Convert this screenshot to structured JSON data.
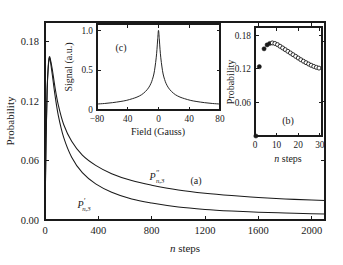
{
  "figure": {
    "background": "#ffffff",
    "ink_color": "#1a1a1a"
  },
  "chart_data": [
    {
      "id": "main",
      "panel_label": "(a)",
      "type": "line",
      "title": "",
      "xlabel": "n steps",
      "ylabel": "Probability",
      "xlim": [
        0,
        2100
      ],
      "ylim": [
        0.0,
        0.2
      ],
      "xticks": [
        0,
        400,
        800,
        1200,
        1600,
        2000
      ],
      "xticklabels": [
        "0",
        "400",
        "800",
        "1200",
        "1600",
        "2000"
      ],
      "yticks": [
        0.0,
        0.06,
        0.12,
        0.18
      ],
      "yticklabels": [
        "0.00",
        "0.06",
        "0.12",
        "0.18"
      ],
      "grid": false,
      "legend": "inline-curve-labels",
      "series": [
        {
          "name": "P''_n,3",
          "label_base": "P",
          "label_sub": "n,3",
          "label_prime": "′′",
          "label_x": 900,
          "label_y": 0.041,
          "comment_shape": "sharp rise to peak near n=30 then slow power-law decay",
          "x": [
            0,
            8,
            16,
            24,
            32,
            40,
            55,
            75,
            100,
            140,
            200,
            280,
            380,
            500,
            650,
            800,
            1000,
            1200,
            1400,
            1600,
            1800,
            2000,
            2100
          ],
          "y": [
            0.0,
            0.082,
            0.132,
            0.155,
            0.1645,
            0.1625,
            0.152,
            0.134,
            0.116,
            0.0965,
            0.0795,
            0.0655,
            0.0552,
            0.0468,
            0.0398,
            0.0352,
            0.0304,
            0.0271,
            0.0247,
            0.0228,
            0.0213,
            0.0201,
            0.0196
          ]
        },
        {
          "name": "P'_n,3",
          "label_base": "P",
          "label_sub": "n,3",
          "label_prime": "′",
          "label_x": 215,
          "label_y": 0.0175,
          "comment_shape": "same sharp rise, faster decay, approaches ~0.006 at n=2100",
          "x": [
            0,
            8,
            16,
            24,
            32,
            40,
            55,
            75,
            100,
            140,
            200,
            280,
            380,
            500,
            650,
            800,
            1000,
            1200,
            1400,
            1600,
            1800,
            2000,
            2100
          ],
          "y": [
            0.0,
            0.081,
            0.13,
            0.153,
            0.1635,
            0.1605,
            0.1465,
            0.126,
            0.1055,
            0.0835,
            0.0635,
            0.0478,
            0.0365,
            0.0281,
            0.0212,
            0.0171,
            0.0131,
            0.0107,
            0.0091,
            0.0079,
            0.0071,
            0.0064,
            0.0061
          ]
        }
      ]
    },
    {
      "id": "inset_c",
      "panel_label": "(c)",
      "type": "line",
      "title": "",
      "xlabel": "Field (Gauss)",
      "ylabel": "Signal (a.u.)",
      "xlim": [
        -80,
        80
      ],
      "ylim": [
        0,
        1.08
      ],
      "xticks": [
        -80,
        -40,
        0,
        40,
        80
      ],
      "xticklabels": [
        "−80",
        "40",
        "0",
        "40",
        "80"
      ],
      "yticks": [
        0,
        0.5,
        1.0
      ],
      "yticklabels": [
        "0",
        "0.5",
        "1.0"
      ],
      "grid": false,
      "series": [
        {
          "name": "signal",
          "comment_shape": "narrow Lorentzian-like peak centred at 0 Gauss, HWHM ~6 G, tails ~0.08",
          "x": [
            -80,
            -70,
            -60,
            -50,
            -42,
            -34,
            -28,
            -22,
            -17,
            -13,
            -10,
            -8,
            -6,
            -4.5,
            -3,
            -2,
            -1,
            0,
            1,
            2,
            3,
            4.5,
            6,
            8,
            10,
            13,
            17,
            22,
            28,
            34,
            42,
            50,
            60,
            70,
            80
          ],
          "y": [
            0.075,
            0.082,
            0.092,
            0.106,
            0.12,
            0.142,
            0.162,
            0.192,
            0.232,
            0.278,
            0.33,
            0.382,
            0.452,
            0.54,
            0.655,
            0.76,
            0.895,
            1.0,
            0.895,
            0.76,
            0.655,
            0.54,
            0.452,
            0.382,
            0.33,
            0.278,
            0.232,
            0.192,
            0.162,
            0.142,
            0.12,
            0.106,
            0.092,
            0.082,
            0.075
          ]
        }
      ]
    },
    {
      "id": "inset_b",
      "panel_label": "(b)",
      "type": "scatter",
      "title": "",
      "xlabel": "n steps",
      "ylabel": "Probability",
      "xlim": [
        0,
        31
      ],
      "ylim": [
        0.0,
        0.195
      ],
      "xticks": [
        0,
        10,
        20,
        30
      ],
      "xticklabels": [
        "0",
        "10",
        "20",
        "30"
      ],
      "yticks": [
        0.06,
        0.12,
        0.18
      ],
      "yticklabels": [
        "0.06",
        "0.12",
        "0.18"
      ],
      "grid": false,
      "series": [
        {
          "name": "measured",
          "marker": "mixed-filled-then-open",
          "comment_shape": "rises from 0 at n=0, point at n=2 ~0.124, peaks ~0.165 near n=8, then slow linear decline to ~0.122 at n=30",
          "points": [
            {
              "x": 0.4,
              "y": 0.0,
              "marker": "filled"
            },
            {
              "x": 2.0,
              "y": 0.124,
              "marker": "filled"
            },
            {
              "x": 4.2,
              "y": 0.156,
              "marker": "filled"
            },
            {
              "x": 5.6,
              "y": 0.163,
              "marker": "filled"
            },
            {
              "x": 6.8,
              "y": 0.1655,
              "marker": "filled"
            },
            {
              "x": 8.0,
              "y": 0.1665,
              "marker": "open"
            },
            {
              "x": 9.2,
              "y": 0.1655,
              "marker": "open"
            },
            {
              "x": 10.4,
              "y": 0.1635,
              "marker": "open"
            },
            {
              "x": 11.6,
              "y": 0.1605,
              "marker": "open"
            },
            {
              "x": 12.8,
              "y": 0.1575,
              "marker": "open"
            },
            {
              "x": 14.0,
              "y": 0.1545,
              "marker": "open"
            },
            {
              "x": 15.2,
              "y": 0.1515,
              "marker": "open"
            },
            {
              "x": 16.4,
              "y": 0.1485,
              "marker": "open"
            },
            {
              "x": 17.6,
              "y": 0.1455,
              "marker": "open"
            },
            {
              "x": 18.8,
              "y": 0.1425,
              "marker": "open"
            },
            {
              "x": 20.0,
              "y": 0.1395,
              "marker": "open"
            },
            {
              "x": 21.2,
              "y": 0.1365,
              "marker": "open"
            },
            {
              "x": 22.4,
              "y": 0.1338,
              "marker": "open"
            },
            {
              "x": 23.6,
              "y": 0.1312,
              "marker": "open"
            },
            {
              "x": 24.8,
              "y": 0.1288,
              "marker": "open"
            },
            {
              "x": 26.0,
              "y": 0.1265,
              "marker": "open"
            },
            {
              "x": 27.2,
              "y": 0.1245,
              "marker": "open"
            },
            {
              "x": 28.4,
              "y": 0.1228,
              "marker": "open"
            },
            {
              "x": 29.6,
              "y": 0.1215,
              "marker": "open"
            }
          ]
        }
      ]
    }
  ]
}
